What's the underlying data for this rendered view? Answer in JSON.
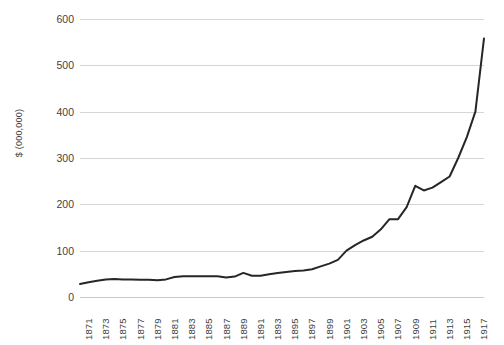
{
  "chart_data": {
    "type": "line",
    "title": "",
    "subtitle": "",
    "xlabel": "",
    "ylabel": "$ (000,000)",
    "ylim": [
      0,
      600
    ],
    "xlim": [
      1871,
      1918
    ],
    "y_ticks": [
      0,
      100,
      200,
      300,
      400,
      500,
      600
    ],
    "y_tick_labels": [
      "0",
      "100",
      "200",
      "300",
      "400",
      "500",
      "600"
    ],
    "x_tick_labels": [
      "1871",
      "1873",
      "1875",
      "1877",
      "1879",
      "1881",
      "1883",
      "1885",
      "1887",
      "1889",
      "1891",
      "1893",
      "1895",
      "1897",
      "1899",
      "1901",
      "1903",
      "1905",
      "1907",
      "1909",
      "1911",
      "1913",
      "1915",
      "1917"
    ],
    "grid": "horizontal",
    "legend": "none",
    "line_color": "#262626",
    "line_width": 2,
    "x": [
      1871,
      1872,
      1873,
      1874,
      1875,
      1876,
      1877,
      1878,
      1879,
      1880,
      1881,
      1882,
      1883,
      1884,
      1885,
      1886,
      1887,
      1888,
      1889,
      1890,
      1891,
      1892,
      1893,
      1894,
      1895,
      1896,
      1897,
      1898,
      1899,
      1900,
      1901,
      1902,
      1903,
      1904,
      1905,
      1906,
      1907,
      1908,
      1909,
      1910,
      1911,
      1912,
      1913,
      1914,
      1915,
      1916,
      1917,
      1918
    ],
    "values": [
      28,
      32,
      35,
      38,
      39,
      38,
      38,
      37,
      37,
      36,
      38,
      43,
      45,
      45,
      45,
      45,
      45,
      42,
      44,
      52,
      46,
      46,
      49,
      52,
      54,
      56,
      57,
      60,
      66,
      72,
      80,
      100,
      112,
      122,
      130,
      146,
      168,
      168,
      194,
      240,
      230,
      236,
      248,
      260,
      300,
      345,
      400,
      558
    ],
    "series": [
      {
        "name": "value",
        "values": [
          28,
          32,
          35,
          38,
          39,
          38,
          38,
          37,
          37,
          36,
          38,
          43,
          45,
          45,
          45,
          45,
          45,
          42,
          44,
          52,
          46,
          46,
          49,
          52,
          54,
          56,
          57,
          60,
          66,
          72,
          80,
          100,
          112,
          122,
          130,
          146,
          168,
          168,
          194,
          240,
          230,
          236,
          248,
          260,
          300,
          345,
          400,
          558
        ]
      }
    ]
  }
}
